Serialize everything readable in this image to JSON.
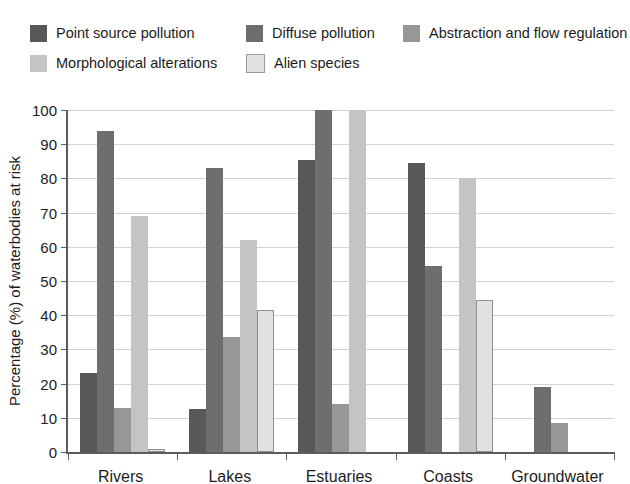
{
  "legend": {
    "rows": [
      [
        {
          "label": "Point source pollution",
          "color": "#585858",
          "outlined": false
        },
        {
          "label": "Diffuse pollution",
          "color": "#6e6e6e",
          "outlined": false
        },
        {
          "label": "Abstraction and flow regulation",
          "color": "#979797",
          "outlined": false
        }
      ],
      [
        {
          "label": "Morphological alterations",
          "color": "#c4c4c4",
          "outlined": false
        },
        {
          "label": "Alien species",
          "color": "#e2e2e2",
          "outlined": true
        }
      ]
    ]
  },
  "chart_data": {
    "type": "bar",
    "title": "",
    "xlabel": "",
    "ylabel": "Percentage (%) of waterbodies at risk",
    "ylim": [
      0,
      100
    ],
    "ytick_step": 10,
    "yticks": [
      "0",
      "10",
      "20",
      "30",
      "40",
      "50",
      "60",
      "70",
      "80",
      "90",
      "100"
    ],
    "grid": true,
    "legend_position": "top",
    "categories": [
      "Rivers",
      "Lakes",
      "Estuaries",
      "Coasts",
      "Groundwater"
    ],
    "series": [
      {
        "name": "Point source pollution",
        "color": "#585858",
        "outlined": false,
        "values": [
          23,
          12.5,
          85.5,
          84.5,
          null
        ]
      },
      {
        "name": "Diffuse pollution",
        "color": "#6e6e6e",
        "outlined": false,
        "values": [
          94,
          83,
          100,
          54.5,
          19
        ]
      },
      {
        "name": "Abstraction and flow regulation",
        "color": "#979797",
        "outlined": false,
        "values": [
          13,
          33.5,
          14,
          null,
          8.5
        ]
      },
      {
        "name": "Morphological alterations",
        "color": "#c4c4c4",
        "outlined": false,
        "values": [
          69,
          62,
          100,
          80,
          null
        ]
      },
      {
        "name": "Alien species",
        "color": "#e2e2e2",
        "outlined": true,
        "values": [
          1,
          41.5,
          null,
          44.5,
          null
        ]
      }
    ]
  }
}
